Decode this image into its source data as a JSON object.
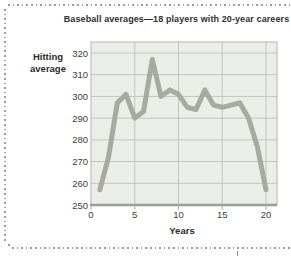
{
  "card": {
    "type": "textbook-figure"
  },
  "chart_data": {
    "type": "line",
    "title": "Baseball averages—18 players with 20-year careers",
    "xlabel": "Years",
    "ylabel": "Hitting average",
    "ylabel_lines": [
      "Hitting",
      "average"
    ],
    "x": [
      1,
      2,
      3,
      4,
      5,
      6,
      7,
      8,
      9,
      10,
      11,
      12,
      13,
      14,
      15,
      16,
      17,
      18,
      19,
      20
    ],
    "values": [
      257,
      272,
      297,
      301,
      290,
      293,
      317,
      300,
      303,
      301,
      295,
      294,
      303,
      296,
      295,
      296,
      297,
      290,
      277,
      257
    ],
    "x_ticks": [
      0,
      5,
      10,
      15,
      20
    ],
    "y_ticks": [
      250,
      260,
      270,
      280,
      290,
      300,
      310,
      320
    ],
    "xlim": [
      0,
      21.3
    ],
    "ylim": [
      250,
      325
    ],
    "grid": true,
    "legend_position": "none"
  },
  "colors": {
    "line": "#a7a9a3",
    "plot_bg": "#ebede9",
    "grid": "#c3c5c1",
    "plot_border": "#b5b7b3",
    "axis": "#9b9d99",
    "text": "#3d3d3d",
    "border_dots": "#9c9c9c"
  }
}
